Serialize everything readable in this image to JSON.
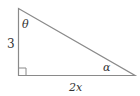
{
  "diagram": {
    "type": "right-triangle",
    "labels": {
      "vertical_side": "3",
      "horizontal_side": "2x",
      "top_angle": "θ",
      "right_angle_at_corner": "α"
    },
    "colors": {
      "stroke": "#8a8a8a",
      "text": "#333333",
      "background": "#ffffff"
    }
  }
}
